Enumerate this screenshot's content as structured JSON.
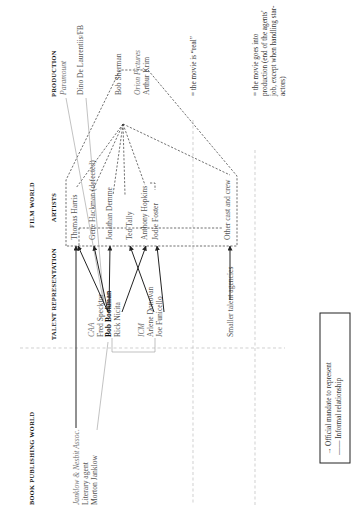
{
  "orientation": "rotated-90-ccw",
  "sections": {
    "book_publishing": "Book publishing world",
    "film_world": "Film world",
    "talent_representation": "Talent representation",
    "artists": "Artists",
    "production": "Production"
  },
  "book_publishing": {
    "agency": "Janklow & Nesbit Assoc.",
    "role": "Literary agent",
    "person": "Morton Janklow"
  },
  "talent": {
    "caa": "CAA",
    "caa_agents": [
      "Fred Specktor",
      "Bob Bookman",
      "Rick Nicita"
    ],
    "icm": "ICM",
    "icm_agents": [
      "Arlene Donovan",
      "Joe Funicello"
    ],
    "smaller": "Smaller talent agencies"
  },
  "artists": [
    "Thomas Harris",
    "Gene Hackman (defected)",
    "Jonathan Demme",
    "Ted Tally",
    "Anthony Hopkins",
    "Jodie Foster",
    "Other cast and crew"
  ],
  "production": {
    "studio1": "Paramount",
    "producer1": "Dino De Laurentiis/FB",
    "person": "Bob Sherman",
    "studio2": "Orion Pictures",
    "person2": "Arthur Krim"
  },
  "milestones": {
    "real": "= the movie is “real”",
    "production_line1": "= the movie goes into",
    "production_line2": "production (end of the agents'",
    "production_line3": "job, except when handling star-",
    "production_line4": "actors)"
  },
  "legend": {
    "official": "→ Official mandate to represent",
    "informal": "—— Informal relationship"
  }
}
